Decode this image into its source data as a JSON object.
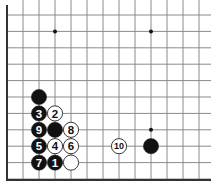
{
  "diagram": {
    "type": "go-board-fragment",
    "colors": {
      "background": "#ffffff",
      "grid": "#8a8a8a",
      "edge": "#333333",
      "black_stone": "#111111",
      "white_stone": "#ffffff",
      "stone_outline": "#222222",
      "hoshi": "#111111"
    },
    "grid": {
      "origin_x": 7,
      "origin_y": 15,
      "col_spacing": 16,
      "row_spacing": 16.4,
      "cols": 13,
      "rows": 11,
      "bottom_edge_y": 180,
      "left_edge_x": 7
    },
    "hoshi": [
      {
        "col": 3,
        "row": 1
      },
      {
        "col": 9,
        "row": 1
      },
      {
        "col": 9,
        "row": 7
      }
    ],
    "stones": [
      {
        "col": 2,
        "row": 5,
        "color": "black",
        "label": ""
      },
      {
        "col": 2,
        "row": 6,
        "color": "black",
        "label": "3"
      },
      {
        "col": 2,
        "row": 7,
        "color": "black",
        "label": "9"
      },
      {
        "col": 2,
        "row": 8,
        "color": "black",
        "label": "5"
      },
      {
        "col": 2,
        "row": 9,
        "color": "black",
        "label": "7"
      },
      {
        "col": 3,
        "row": 6,
        "color": "white",
        "label": "2"
      },
      {
        "col": 3,
        "row": 7,
        "color": "black",
        "label": ""
      },
      {
        "col": 3,
        "row": 8,
        "color": "white",
        "label": "4"
      },
      {
        "col": 3,
        "row": 9,
        "color": "black",
        "label": "1"
      },
      {
        "col": 4,
        "row": 7,
        "color": "white",
        "label": "8"
      },
      {
        "col": 4,
        "row": 8,
        "color": "white",
        "label": "6"
      },
      {
        "col": 4,
        "row": 9,
        "color": "white",
        "label": ""
      },
      {
        "col": 7,
        "row": 8,
        "color": "white",
        "label": "10"
      },
      {
        "col": 9,
        "row": 8,
        "color": "black",
        "label": ""
      }
    ]
  }
}
